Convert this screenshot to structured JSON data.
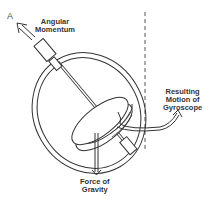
{
  "diagram": {
    "point_label": "A",
    "labels": {
      "angular_momentum": [
        "Angular",
        "Momentum"
      ],
      "resulting_motion": [
        "Resulting",
        "Motion of",
        "Gyroscope"
      ],
      "force_of_gravity": [
        "Force of",
        "Gravity"
      ]
    },
    "colors": {
      "stroke": "#333333",
      "background": "#ffffff"
    }
  }
}
